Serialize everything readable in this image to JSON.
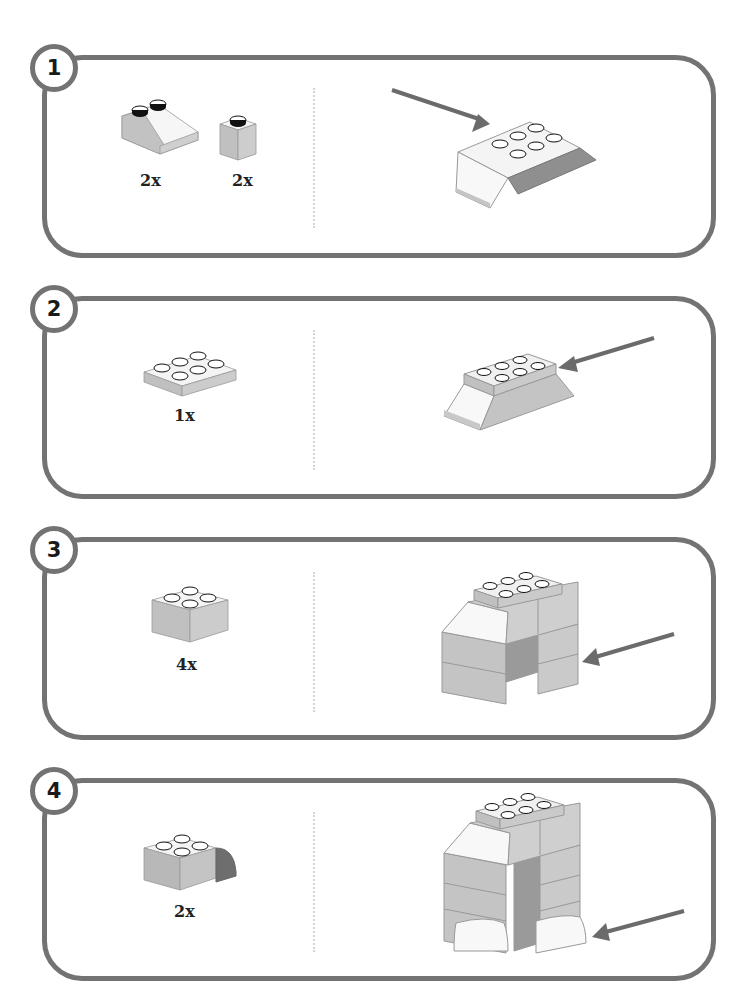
{
  "colors": {
    "border": "#737373",
    "arrow": "#6b6b6b",
    "brick_side": "#bdbdbd",
    "brick_top": "#f4f4f4",
    "brick_dark": "#8e8e8e",
    "stud_dark": "#111111"
  },
  "steps": [
    {
      "number": "1",
      "parts": [
        {
          "name": "slope-brick-2x2",
          "qty": "2x"
        },
        {
          "name": "brick-1x1",
          "qty": "2x"
        }
      ],
      "result": "slope-assembly-2x3-with-arrow"
    },
    {
      "number": "2",
      "parts": [
        {
          "name": "plate-2x3",
          "qty": "1x"
        }
      ],
      "result": "plate-on-slope-assembly-with-arrow"
    },
    {
      "number": "3",
      "parts": [
        {
          "name": "brick-2x2",
          "qty": "4x"
        }
      ],
      "result": "legs-assembly-with-arrow"
    },
    {
      "number": "4",
      "parts": [
        {
          "name": "curved-brick-2x2",
          "qty": "2x"
        }
      ],
      "result": "legs-with-feet-assembly-with-arrow"
    }
  ]
}
